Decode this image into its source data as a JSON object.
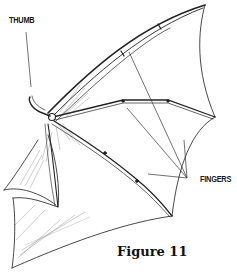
{
  "figure": {
    "caption": "Figure 11"
  },
  "labels": {
    "thumb": "THUMB",
    "fingers": "FINGERS"
  },
  "colors": {
    "ink": "#1a1a1a",
    "shading": "#555555",
    "light_line": "#888888",
    "background": "#ffffff"
  }
}
